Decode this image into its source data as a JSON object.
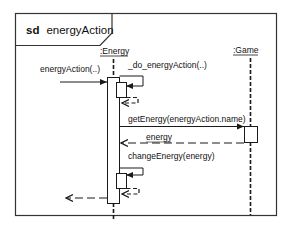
{
  "diagram": {
    "type": "UML sequence diagram",
    "frame": {
      "keyword": "sd",
      "name": "energyAction"
    },
    "lifelines": [
      {
        "id": "energy",
        "label": ":Energy"
      },
      {
        "id": "game",
        "label": ":Game"
      }
    ],
    "messages": [
      {
        "id": "m1",
        "label": "energyAction(..)",
        "from": "external",
        "to": "energy",
        "kind": "synchronous"
      },
      {
        "id": "m2",
        "label": "_do_energyAction(..)",
        "from": "energy",
        "to": "energy",
        "kind": "self-call"
      },
      {
        "id": "m2r",
        "label": "",
        "from": "energy",
        "to": "energy",
        "kind": "return"
      },
      {
        "id": "m3",
        "label": "getEnergy(energyAction.name)",
        "from": "energy",
        "to": "game",
        "kind": "synchronous"
      },
      {
        "id": "m3r",
        "label": "energy",
        "from": "game",
        "to": "energy",
        "kind": "return"
      },
      {
        "id": "m4",
        "label": "changeEnergy(energy)",
        "from": "energy",
        "to": "energy",
        "kind": "self-call"
      },
      {
        "id": "m4r",
        "label": "",
        "from": "energy",
        "to": "energy",
        "kind": "return"
      },
      {
        "id": "m1r",
        "label": "",
        "from": "energy",
        "to": "external",
        "kind": "return"
      }
    ],
    "colors": {
      "line": "#1a1a1a",
      "background": "#ffffff"
    }
  }
}
